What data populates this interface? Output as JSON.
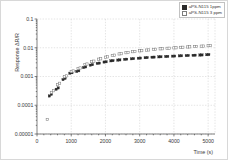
{
  "chart_data": {
    "type": "scatter",
    "title": "",
    "xlabel": "Time (s)",
    "ylabel": "Response ΔR/R",
    "yscale": "log",
    "xlim": [
      0,
      5200
    ],
    "ylim": [
      1e-05,
      0.1
    ],
    "grid": true,
    "legend_position": "top-right",
    "xticks": [
      0,
      1000,
      2000,
      3000,
      4000,
      5000
    ],
    "xtick_labels": [
      "0",
      "1000",
      "2000",
      "3000",
      "4000",
      "5000"
    ],
    "yticks": [
      0.1,
      0.01,
      0.001,
      0.0001,
      1e-05
    ],
    "ytick_labels": [
      "0.1",
      "0.01",
      "0.001",
      "0.0001",
      "0.00001"
    ],
    "series": [
      {
        "name": "aPS-N115 1ppm",
        "marker": "filled-square",
        "color": "#2a2a2a",
        "points": [
          [
            360,
            0.00021
          ],
          [
            420,
            0.00024
          ],
          [
            560,
            0.00036
          ],
          [
            620,
            0.0004
          ],
          [
            760,
            0.00078
          ],
          [
            820,
            0.00086
          ],
          [
            960,
            0.0013
          ],
          [
            1020,
            0.00135
          ],
          [
            1160,
            0.0015
          ],
          [
            1220,
            0.00158
          ],
          [
            1360,
            0.00205
          ],
          [
            1420,
            0.00215
          ],
          [
            1560,
            0.00248
          ],
          [
            1620,
            0.00258
          ],
          [
            1760,
            0.00285
          ],
          [
            1820,
            0.00292
          ],
          [
            1960,
            0.00318
          ],
          [
            2020,
            0.00325
          ],
          [
            2160,
            0.0035
          ],
          [
            2220,
            0.00356
          ],
          [
            2360,
            0.00372
          ],
          [
            2420,
            0.00378
          ],
          [
            2560,
            0.00395
          ],
          [
            2620,
            0.004
          ],
          [
            2760,
            0.00412
          ],
          [
            2820,
            0.00418
          ],
          [
            2960,
            0.00432
          ],
          [
            3020,
            0.00438
          ],
          [
            3160,
            0.0045
          ],
          [
            3220,
            0.00455
          ],
          [
            3360,
            0.00468
          ],
          [
            3420,
            0.00472
          ],
          [
            3560,
            0.00482
          ],
          [
            3620,
            0.00486
          ],
          [
            3760,
            0.00495
          ],
          [
            3820,
            0.005
          ],
          [
            3960,
            0.0051
          ],
          [
            4020,
            0.00514
          ],
          [
            4160,
            0.00522
          ],
          [
            4220,
            0.00526
          ],
          [
            4360,
            0.00534
          ],
          [
            4420,
            0.00538
          ],
          [
            4560,
            0.00546
          ],
          [
            4620,
            0.0055
          ],
          [
            4760,
            0.00558
          ],
          [
            4820,
            0.00562
          ],
          [
            4960,
            0.00572
          ],
          [
            5020,
            0.00578
          ]
        ]
      },
      {
        "name": "aPS-N115 3 ppm",
        "marker": "open-square",
        "color": "#7d7d7d",
        "points": [
          [
            300,
            3.2e-05
          ],
          [
            420,
            0.00028
          ],
          [
            480,
            0.00032
          ],
          [
            600,
            0.00052
          ],
          [
            660,
            0.00058
          ],
          [
            800,
            0.00098
          ],
          [
            860,
            0.00105
          ],
          [
            1000,
            0.00148
          ],
          [
            1060,
            0.00156
          ],
          [
            1200,
            0.0019
          ],
          [
            1260,
            0.00198
          ],
          [
            1400,
            0.00262
          ],
          [
            1460,
            0.00272
          ],
          [
            1600,
            0.0033
          ],
          [
            1660,
            0.00342
          ],
          [
            1800,
            0.004
          ],
          [
            1860,
            0.00412
          ],
          [
            2000,
            0.0047
          ],
          [
            2060,
            0.00482
          ],
          [
            2200,
            0.0054
          ],
          [
            2260,
            0.00552
          ],
          [
            2400,
            0.0061
          ],
          [
            2460,
            0.00622
          ],
          [
            2600,
            0.00672
          ],
          [
            2660,
            0.00682
          ],
          [
            2800,
            0.0073
          ],
          [
            2860,
            0.0074
          ],
          [
            3000,
            0.00782
          ],
          [
            3060,
            0.00792
          ],
          [
            3200,
            0.0083
          ],
          [
            3260,
            0.0084
          ],
          [
            3400,
            0.00876
          ],
          [
            3460,
            0.00884
          ],
          [
            3600,
            0.00916
          ],
          [
            3660,
            0.00924
          ],
          [
            3800,
            0.00954
          ],
          [
            3860,
            0.00962
          ],
          [
            4000,
            0.0099
          ],
          [
            4060,
            0.00998
          ],
          [
            4200,
            0.0103
          ],
          [
            4260,
            0.01038
          ],
          [
            4400,
            0.01066
          ],
          [
            4460,
            0.01074
          ],
          [
            4600,
            0.011
          ],
          [
            4660,
            0.01108
          ],
          [
            4800,
            0.01136
          ],
          [
            4860,
            0.01144
          ],
          [
            5000,
            0.0118
          ],
          [
            5060,
            0.0119
          ]
        ]
      }
    ]
  },
  "legend": {
    "items": [
      {
        "label": "aPS-N115 1ppm",
        "marker": "filled-square"
      },
      {
        "label": "aPS-N115 3 ppm",
        "marker": "open-square"
      }
    ]
  }
}
